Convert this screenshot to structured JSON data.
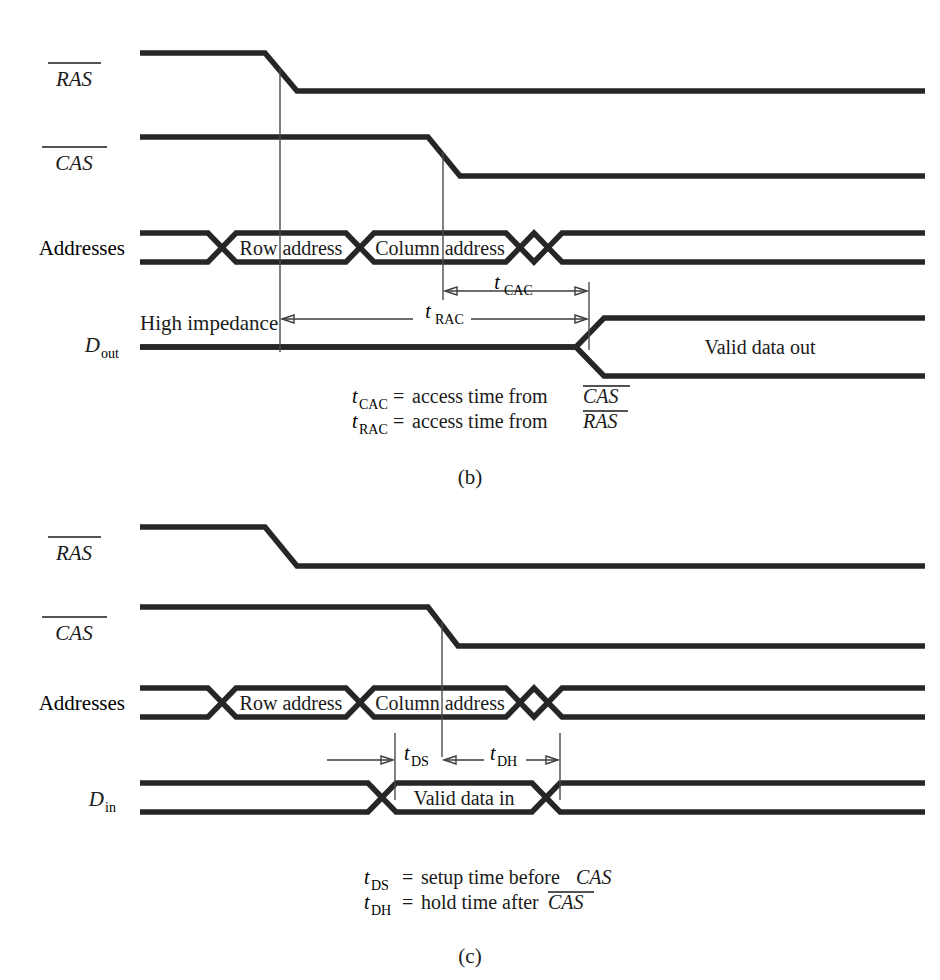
{
  "figure": {
    "background_color": "#ffffff",
    "wave_color": "#262626",
    "guide_color": "#4a4a4a"
  },
  "panels": [
    {
      "id": "b",
      "letter": "(b)",
      "kind": "read-cycle",
      "signals": [
        {
          "name": "RAS",
          "label": "RAS",
          "overbar": true,
          "subscript": ""
        },
        {
          "name": "CAS",
          "label": "CAS",
          "overbar": true,
          "subscript": ""
        },
        {
          "name": "Addresses",
          "label": "Addresses",
          "overbar": false,
          "subscript": ""
        },
        {
          "name": "Dout",
          "label": "D",
          "overbar": false,
          "subscript": "out"
        }
      ],
      "bus_segments": [
        {
          "label": "Row address"
        },
        {
          "label": "Column address"
        },
        {
          "label": "Valid data out"
        }
      ],
      "annotations": [
        {
          "name": "high-impedance",
          "label": "High impedance"
        },
        {
          "name": "t-cac",
          "symbol": "t",
          "subscript": "CAC"
        },
        {
          "name": "t-rac",
          "symbol": "t",
          "subscript": "RAC"
        }
      ],
      "legend": [
        {
          "symbol": "t",
          "subscript": "CAC",
          "equals": "=",
          "text": "access time from",
          "signal": "CAS",
          "overbar": true
        },
        {
          "symbol": "t",
          "subscript": "RAC",
          "equals": "=",
          "text": "access time from",
          "signal": "RAS",
          "overbar": true
        }
      ]
    },
    {
      "id": "c",
      "letter": "(c)",
      "kind": "write-cycle",
      "signals": [
        {
          "name": "RAS",
          "label": "RAS",
          "overbar": true,
          "subscript": ""
        },
        {
          "name": "CAS",
          "label": "CAS",
          "overbar": true,
          "subscript": ""
        },
        {
          "name": "Addresses",
          "label": "Addresses",
          "overbar": false,
          "subscript": ""
        },
        {
          "name": "Din",
          "label": "D",
          "overbar": false,
          "subscript": "in"
        }
      ],
      "bus_segments": [
        {
          "label": "Row address"
        },
        {
          "label": "Column address"
        },
        {
          "label": "Valid data in"
        }
      ],
      "annotations": [
        {
          "name": "t-ds",
          "symbol": "t",
          "subscript": "DS"
        },
        {
          "name": "t-dh",
          "symbol": "t",
          "subscript": "DH"
        }
      ],
      "legend": [
        {
          "symbol": "t",
          "subscript": "DS",
          "equals": "=",
          "text": "setup time before",
          "signal": "CAS",
          "overbar": false
        },
        {
          "symbol": "t",
          "subscript": "DH",
          "equals": "=",
          "text": "hold time after",
          "signal": "CAS",
          "overbar": true
        }
      ]
    }
  ]
}
